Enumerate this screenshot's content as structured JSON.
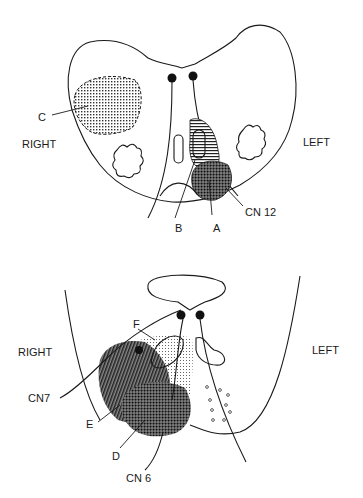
{
  "top_section": {
    "side_left_label": "RIGHT",
    "side_right_label": "LEFT",
    "labels": {
      "c": "C",
      "b": "B",
      "a": "A",
      "cn12": "CN 12"
    }
  },
  "bottom_section": {
    "side_left_label": "RIGHT",
    "side_right_label": "LEFT",
    "labels": {
      "f": "F",
      "cn7": "CN7",
      "e": "E",
      "d": "D",
      "cn6": "CN 6"
    }
  },
  "colors": {
    "ink": "#1a1a1a",
    "background": "#ffffff"
  }
}
